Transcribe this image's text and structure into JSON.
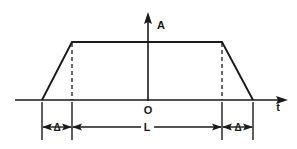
{
  "figure": {
    "background_color": "#ffffff",
    "ink_color": "#1a1a1a",
    "axes": {
      "vertical": {
        "label": "A",
        "icon": "arrow-up-icon",
        "label_x": 161,
        "label_y": 29,
        "x": 148,
        "y_top": 12,
        "y_bottom": 101
      },
      "horizontal": {
        "label": "t",
        "icon": "arrow-right-icon",
        "label_x": 278,
        "label_y": 111,
        "y": 100,
        "x_left": 15,
        "x_right": 288
      },
      "origin": {
        "label": "O",
        "label_x": 148,
        "label_y": 114
      }
    },
    "dimensions": [
      {
        "name": "rise-time",
        "label": "Δ",
        "label_x": 57,
        "from_x": 42,
        "to_x": 72
      },
      {
        "name": "pulse-width",
        "label": "L",
        "label_x": 147,
        "from_x": 72,
        "to_x": 222
      },
      {
        "name": "fall-time",
        "label": "Δ",
        "label_x": 238,
        "from_x": 222,
        "to_x": 253
      }
    ],
    "dimension_line_y": 127,
    "extension_line_top_y": 102,
    "extension_line_bottom_y": 140,
    "waveform": {
      "name": "trapezoidal-pulse",
      "baseline_y": 100,
      "plateau_y": 42,
      "points": [
        {
          "x": 42,
          "y": 100
        },
        {
          "x": 72,
          "y": 42
        },
        {
          "x": 222,
          "y": 42
        },
        {
          "x": 253,
          "y": 100
        }
      ],
      "dashed_drop_lines": [
        {
          "x": 72,
          "y_top": 43,
          "y_bottom": 100
        },
        {
          "x": 222,
          "y_top": 43,
          "y_bottom": 100
        }
      ]
    }
  }
}
